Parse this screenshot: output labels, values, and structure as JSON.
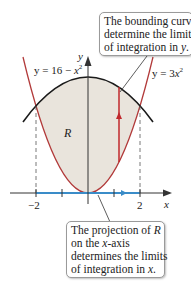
{
  "figure": {
    "type": "region-between-curves",
    "colors": {
      "region_fill": "#e9e4dc",
      "upper_curve": "#1a1a1a",
      "lower_curve": "#b23a3a",
      "vertical_segment": "#c0282d",
      "projection": "#3a8cc8",
      "axes": "#333333",
      "dashed_guides": "#555555"
    },
    "curves": {
      "upper": {
        "label_prefix": "y = 16 − ",
        "label_var": "x",
        "label_exp": "2",
        "equation": "y = 16 - x^2"
      },
      "lower": {
        "label_prefix": "y = 3",
        "label_var": "x",
        "label_exp": "2",
        "equation": "y = 3x^2"
      }
    },
    "region_label": "R",
    "axes": {
      "x_label": "x",
      "y_label": "y",
      "x_ticks": [
        {
          "value": -2,
          "label": "−2"
        },
        {
          "value": -1,
          "label": ""
        },
        {
          "value": 1,
          "label": ""
        },
        {
          "value": 2,
          "label": "2"
        }
      ]
    },
    "intersections": [
      [
        -2,
        12
      ],
      [
        2,
        12
      ]
    ],
    "integration_limits": {
      "x": [
        -2,
        2
      ],
      "y": [
        "3x^2",
        "16 - x^2"
      ]
    }
  },
  "callouts": {
    "top": {
      "lines": [
        "The bounding curves",
        "determine the limits",
        "of integration in "
      ],
      "var": "y",
      "end": "."
    },
    "bottom": {
      "line1_prefix": "The projection of ",
      "line1_var": "R",
      "line2_prefix": "on the ",
      "line2_var": "x",
      "line2_suffix": "-axis",
      "line3": "determines the limits",
      "line4_prefix": "of integration in ",
      "line4_var": "x",
      "line4_end": "."
    }
  }
}
